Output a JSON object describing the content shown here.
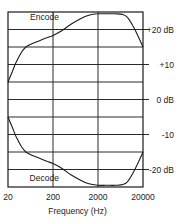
{
  "chart_data": {
    "type": "line",
    "title": "",
    "xlabel": "Frequency (Hz)",
    "ylabel": "",
    "x_scale": "log",
    "xlim": [
      20,
      20000
    ],
    "ylim": [
      -25,
      25
    ],
    "grid": true,
    "x_ticks": [
      {
        "value": 20,
        "label": "20"
      },
      {
        "value": 200,
        "label": "200"
      },
      {
        "value": 2000,
        "label": "2000"
      },
      {
        "value": 20000,
        "label": "20000"
      }
    ],
    "y_ticks": [
      {
        "value": 20,
        "label": "+20 dB"
      },
      {
        "value": 10,
        "label": "+10"
      },
      {
        "value": 0,
        "label": "0 dB"
      },
      {
        "value": -10,
        "label": "-10"
      },
      {
        "value": -20,
        "label": "-20 dB"
      }
    ],
    "y_gridlines": [
      25,
      20,
      15,
      10,
      5,
      0,
      -5,
      -10,
      -15,
      -20,
      -25
    ],
    "series": [
      {
        "name": "Encode",
        "x": [
          20,
          25,
          30,
          40,
          50,
          70,
          100,
          150,
          200,
          300,
          500,
          800,
          1200,
          2000,
          3000,
          5000,
          7000,
          9000,
          12000,
          15000,
          20000
        ],
        "y": [
          5,
          8,
          10.5,
          13.5,
          15,
          16,
          16.8,
          17.7,
          18.3,
          19.5,
          21.5,
          23,
          24,
          24.5,
          24.5,
          24.5,
          24.3,
          23.5,
          21,
          18.5,
          15
        ]
      },
      {
        "name": "Decode",
        "x": [
          20,
          25,
          30,
          40,
          50,
          70,
          100,
          150,
          200,
          300,
          500,
          800,
          1200,
          2000,
          3000,
          5000,
          7000,
          9000,
          12000,
          15000,
          20000
        ],
        "y": [
          -5,
          -8,
          -10.5,
          -13.5,
          -15,
          -16,
          -16.8,
          -17.7,
          -18.3,
          -19.5,
          -21.5,
          -23,
          -24,
          -24.5,
          -24.5,
          -24.5,
          -24.3,
          -23.5,
          -21,
          -18.5,
          -15
        ]
      }
    ],
    "annotations": [
      {
        "text": "Encode",
        "series": "Encode",
        "x": 300,
        "y": 23.5
      },
      {
        "text": "Decode",
        "series": "Decode",
        "x": 300,
        "y": -22.5
      }
    ]
  }
}
